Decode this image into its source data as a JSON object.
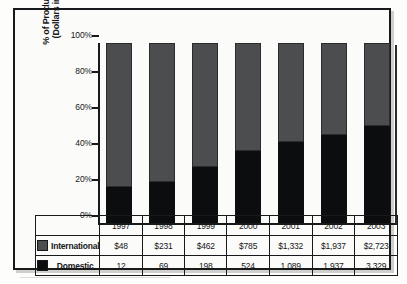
{
  "chart_data": {
    "type": "bar",
    "subtype": "stacked-100-percent",
    "title": "",
    "xlabel": "",
    "ylabel": "% of Product Revenue (Dollars in Millions)",
    "ylabel_lines": [
      "% of Product Revenue",
      "(Dollars in Millions)"
    ],
    "ylim": [
      0,
      100
    ],
    "ytick_labels": [
      "100%",
      "80%",
      "60%",
      "40%",
      "20%",
      "0%"
    ],
    "ytick_values": [
      100,
      80,
      60,
      40,
      20,
      0
    ],
    "grid": false,
    "legend_position": "table-left-column",
    "categories": [
      "1997",
      "1998",
      "1999",
      "2000",
      "2001",
      "2002",
      "2003"
    ],
    "series": [
      {
        "name": "International",
        "color": "#4c4d4e",
        "stack_order": "top",
        "values": [
          48,
          231,
          462,
          785,
          1332,
          1937,
          2723
        ],
        "labels": [
          "$48",
          "$231",
          "$462",
          "$785",
          "$1,332",
          "$1,937",
          "$2,723"
        ],
        "percent_of_total": [
          80,
          77,
          69,
          60,
          55,
          51,
          46
        ]
      },
      {
        "name": "Domestic",
        "color": "#0c0d0e",
        "stack_order": "bottom",
        "values": [
          12,
          69,
          198,
          524,
          1089,
          1937,
          3329
        ],
        "labels": [
          "12",
          "69",
          "198",
          "524",
          "1,089",
          "1,937",
          "3,329"
        ],
        "percent_of_total": [
          20,
          23,
          31,
          40,
          45,
          49,
          54
        ]
      }
    ]
  },
  "table": {
    "year_row": [
      "1997",
      "1998",
      "1999",
      "2000",
      "2001",
      "2002",
      "2003"
    ],
    "rows": [
      {
        "label": "International",
        "swatch": "gray-swatch",
        "cells": [
          "$48",
          "$231",
          "$462",
          "$785",
          "$1,332",
          "$1,937",
          "$2,723"
        ]
      },
      {
        "label": "Domestic",
        "swatch": "black-swatch",
        "cells": [
          "12",
          "69",
          "198",
          "524",
          "1,089",
          "1,937",
          "3,329"
        ]
      }
    ]
  },
  "colors": {
    "international": "#4c4d4e",
    "domestic": "#0c0d0e",
    "frame": "#17191a",
    "background": "#fbfbf9"
  }
}
